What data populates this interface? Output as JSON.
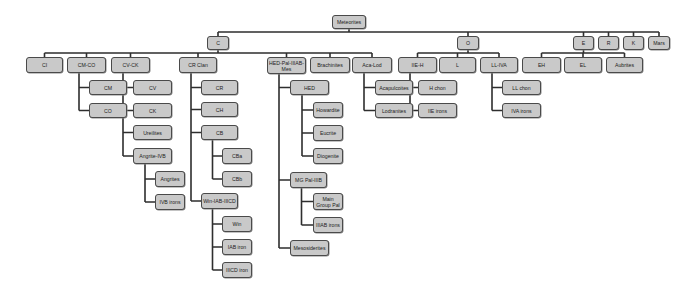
{
  "diagram": {
    "title": "Meteorites",
    "nodes": [
      {
        "id": "meteorites",
        "label": "Meteorites",
        "x": 332,
        "y": 15,
        "w": 34,
        "h": 14,
        "parent": null
      },
      {
        "id": "c",
        "label": "C",
        "x": 207,
        "y": 36,
        "w": 22,
        "h": 14,
        "parent": "meteorites"
      },
      {
        "id": "o",
        "label": "O",
        "x": 457,
        "y": 36,
        "w": 22,
        "h": 14,
        "parent": "meteorites"
      },
      {
        "id": "e",
        "label": "E",
        "x": 573,
        "y": 36,
        "w": 21,
        "h": 14,
        "parent": "meteorites"
      },
      {
        "id": "r",
        "label": "R",
        "x": 598,
        "y": 36,
        "w": 21,
        "h": 14,
        "parent": "meteorites"
      },
      {
        "id": "k",
        "label": "K",
        "x": 623,
        "y": 36,
        "w": 21,
        "h": 14,
        "parent": "meteorites"
      },
      {
        "id": "mars",
        "label": "Mars",
        "x": 648,
        "y": 36,
        "w": 22,
        "h": 14,
        "parent": "meteorites"
      },
      {
        "id": "ci",
        "label": "CI",
        "x": 26,
        "y": 57,
        "w": 37,
        "h": 16,
        "parent": "c"
      },
      {
        "id": "cmco",
        "label": "CM-CO",
        "x": 67,
        "y": 57,
        "w": 39,
        "h": 16,
        "parent": "c"
      },
      {
        "id": "cvck",
        "label": "CV-CK",
        "x": 111,
        "y": 57,
        "w": 39,
        "h": 16,
        "parent": "c"
      },
      {
        "id": "crclan",
        "label": "CR Clan",
        "x": 179,
        "y": 57,
        "w": 38,
        "h": 16,
        "parent": "c"
      },
      {
        "id": "hedpal",
        "label": "HED-Pal-IIIAB-Mes",
        "x": 267,
        "y": 57,
        "w": 39,
        "h": 17,
        "parent": "c"
      },
      {
        "id": "brach",
        "label": "Brachinites",
        "x": 310,
        "y": 57,
        "w": 40,
        "h": 16,
        "parent": "c"
      },
      {
        "id": "acalod",
        "label": "Aca-Lod",
        "x": 352,
        "y": 57,
        "w": 40,
        "h": 16,
        "parent": "c"
      },
      {
        "id": "iieh",
        "label": "IIE-H",
        "x": 398,
        "y": 57,
        "w": 39,
        "h": 16,
        "parent": "o"
      },
      {
        "id": "l",
        "label": "L",
        "x": 439,
        "y": 57,
        "w": 37,
        "h": 16,
        "parent": "o"
      },
      {
        "id": "llivA",
        "label": "LL-IVA",
        "x": 480,
        "y": 57,
        "w": 38,
        "h": 16,
        "parent": "o"
      },
      {
        "id": "eh",
        "label": "EH",
        "x": 522,
        "y": 57,
        "w": 39,
        "h": 16,
        "parent": "e"
      },
      {
        "id": "el",
        "label": "EL",
        "x": 564,
        "y": 57,
        "w": 38,
        "h": 16,
        "parent": "e"
      },
      {
        "id": "aub",
        "label": "Aubrites",
        "x": 606,
        "y": 57,
        "w": 37,
        "h": 16,
        "parent": "e"
      },
      {
        "id": "cm",
        "label": "CM",
        "x": 89,
        "y": 80,
        "w": 38,
        "h": 15,
        "parent": "cmco"
      },
      {
        "id": "co",
        "label": "CO",
        "x": 89,
        "y": 103,
        "w": 38,
        "h": 15,
        "parent": "cmco"
      },
      {
        "id": "cv",
        "label": "CV",
        "x": 133,
        "y": 80,
        "w": 39,
        "h": 15,
        "parent": "cvck"
      },
      {
        "id": "ck",
        "label": "CK",
        "x": 133,
        "y": 103,
        "w": 39,
        "h": 15,
        "parent": "cvck"
      },
      {
        "id": "ure",
        "label": "Ureilites",
        "x": 133,
        "y": 125,
        "w": 39,
        "h": 15,
        "parent": "cvck"
      },
      {
        "id": "angivb",
        "label": "Angrite-IVB",
        "x": 133,
        "y": 148,
        "w": 39,
        "h": 16,
        "parent": "cvck"
      },
      {
        "id": "ang",
        "label": "Angrites",
        "x": 155,
        "y": 171,
        "w": 30,
        "h": 16,
        "parent": "angivb"
      },
      {
        "id": "ivb",
        "label": "IVB irons",
        "x": 155,
        "y": 194,
        "w": 30,
        "h": 16,
        "parent": "angivb"
      },
      {
        "id": "cr",
        "label": "CR",
        "x": 201,
        "y": 80,
        "w": 37,
        "h": 15,
        "parent": "crclan"
      },
      {
        "id": "ch",
        "label": "CH",
        "x": 201,
        "y": 102,
        "w": 37,
        "h": 15,
        "parent": "crclan"
      },
      {
        "id": "cb",
        "label": "CB",
        "x": 201,
        "y": 125,
        "w": 37,
        "h": 15,
        "parent": "crclan"
      },
      {
        "id": "cba",
        "label": "CBa",
        "x": 222,
        "y": 148,
        "w": 30,
        "h": 16,
        "parent": "cb"
      },
      {
        "id": "cbb",
        "label": "CBb",
        "x": 222,
        "y": 171,
        "w": 30,
        "h": 16,
        "parent": "cb"
      },
      {
        "id": "winiab",
        "label": "Win-IAB-IIICD",
        "x": 201,
        "y": 193,
        "w": 37,
        "h": 16,
        "parent": "crclan"
      },
      {
        "id": "win",
        "label": "Win",
        "x": 222,
        "y": 216,
        "w": 30,
        "h": 16,
        "parent": "winiab"
      },
      {
        "id": "iab",
        "label": "IAB iron",
        "x": 222,
        "y": 239,
        "w": 30,
        "h": 16,
        "parent": "winiab"
      },
      {
        "id": "iiicd",
        "label": "IIICD iron",
        "x": 222,
        "y": 262,
        "w": 30,
        "h": 16,
        "parent": "winiab"
      },
      {
        "id": "hed",
        "label": "HED",
        "x": 290,
        "y": 80,
        "w": 39,
        "h": 15,
        "parent": "hedpal"
      },
      {
        "id": "how",
        "label": "Howardite",
        "x": 313,
        "y": 102,
        "w": 30,
        "h": 16,
        "parent": "hed"
      },
      {
        "id": "euc",
        "label": "Eucrite",
        "x": 313,
        "y": 125,
        "w": 30,
        "h": 16,
        "parent": "hed"
      },
      {
        "id": "dio",
        "label": "Diogenite",
        "x": 313,
        "y": 148,
        "w": 30,
        "h": 16,
        "parent": "hed"
      },
      {
        "id": "mgpal",
        "label": "MG Pal-IIIB",
        "x": 290,
        "y": 172,
        "w": 37,
        "h": 16,
        "parent": "hedpal"
      },
      {
        "id": "mainpal",
        "label": "Main Group Pal",
        "x": 313,
        "y": 193,
        "w": 30,
        "h": 17,
        "parent": "mgpal"
      },
      {
        "id": "iiiab",
        "label": "IIIAB irons",
        "x": 313,
        "y": 217,
        "w": 30,
        "h": 16,
        "parent": "mgpal"
      },
      {
        "id": "meso",
        "label": "Mesosiderites",
        "x": 290,
        "y": 240,
        "w": 39,
        "h": 16,
        "parent": "hedpal"
      },
      {
        "id": "aca",
        "label": "Acapulcoites",
        "x": 375,
        "y": 80,
        "w": 38,
        "h": 15,
        "parent": "acalod"
      },
      {
        "id": "lod",
        "label": "Lodranites",
        "x": 375,
        "y": 103,
        "w": 38,
        "h": 15,
        "parent": "acalod"
      },
      {
        "id": "hchon",
        "label": "H chon",
        "x": 418,
        "y": 80,
        "w": 39,
        "h": 15,
        "parent": "iieh"
      },
      {
        "id": "iieirons",
        "label": "IIE irons",
        "x": 418,
        "y": 103,
        "w": 39,
        "h": 15,
        "parent": "iieh"
      },
      {
        "id": "llchon",
        "label": "LL chon",
        "x": 502,
        "y": 80,
        "w": 39,
        "h": 15,
        "parent": "llivA"
      },
      {
        "id": "ivairons",
        "label": "IVA irons",
        "x": 502,
        "y": 103,
        "w": 39,
        "h": 15,
        "parent": "llivA"
      }
    ],
    "edges_style": {
      "horizontal_children": [
        "meteorites",
        "c",
        "o",
        "e"
      ]
    },
    "colors": {
      "node_fill": "#c9c9c9",
      "node_border": "#4a4a4a",
      "line": "#2e2e2e",
      "background": "#ffffff"
    }
  }
}
